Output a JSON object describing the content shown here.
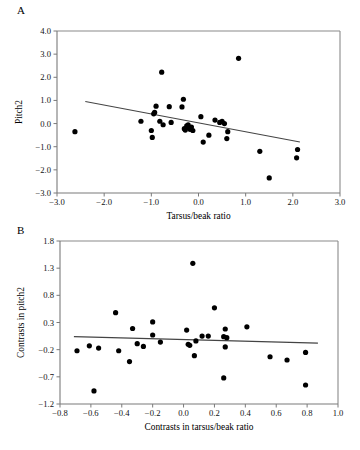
{
  "figure": {
    "background": "#ffffff",
    "point_color": "#000000",
    "line_color": "#444444",
    "axis_color": "#7a7a7a"
  },
  "panels": [
    {
      "letter": "A",
      "id": "panel-a"
    },
    {
      "letter": "B",
      "id": "panel-b"
    }
  ],
  "chart_data": [
    {
      "type": "scatter",
      "panel": "A",
      "title": "",
      "xlabel": "Tarsus/beak ratio",
      "ylabel": "Pitch2",
      "xlim": [
        -3.0,
        3.0
      ],
      "ylim": [
        -3.0,
        4.0
      ],
      "xticks": [
        -3.0,
        -2.0,
        -1.0,
        0.0,
        1.0,
        2.0,
        3.0
      ],
      "xtick_labels": [
        "-3.0",
        "-2.0",
        "-1.0",
        "0.0",
        "1.0",
        "2.0",
        "3.0"
      ],
      "yticks": [
        -3.0,
        -2.0,
        -1.0,
        0.0,
        1.0,
        2.0,
        3.0,
        4.0
      ],
      "ytick_labels": [
        "-3.0",
        "-2.0",
        "-1.0",
        "0.0",
        "1.0",
        "2.0",
        "3.0",
        "4.0"
      ],
      "grid": false,
      "legend": false,
      "x": [
        -2.62,
        -1.22,
        -1.0,
        -0.98,
        -0.95,
        -0.93,
        -0.9,
        -0.82,
        -0.78,
        -0.75,
        -0.62,
        -0.58,
        -0.35,
        -0.32,
        -0.3,
        -0.28,
        -0.25,
        -0.22,
        -0.2,
        -0.18,
        -0.15,
        -0.12,
        0.05,
        0.1,
        0.22,
        0.35,
        0.45,
        0.5,
        0.55,
        0.6,
        0.62,
        0.85,
        1.3,
        1.5,
        2.08,
        2.1
      ],
      "y": [
        -0.35,
        0.1,
        -0.3,
        -0.6,
        0.42,
        0.48,
        0.75,
        0.1,
        2.22,
        -0.05,
        0.73,
        0.05,
        0.72,
        1.05,
        -0.22,
        -0.28,
        -0.1,
        -0.05,
        -0.18,
        -0.25,
        -0.15,
        -0.3,
        0.3,
        -0.8,
        -0.5,
        0.15,
        0.05,
        0.1,
        0.0,
        -0.65,
        -0.35,
        2.82,
        -1.2,
        -2.35,
        -1.48,
        -1.12
      ],
      "trendline": {
        "x0": -2.4,
        "y0": 0.95,
        "x1": 2.15,
        "y1": -0.8,
        "slope": -0.385,
        "intercept": 0.026
      }
    },
    {
      "type": "scatter",
      "panel": "B",
      "title": "",
      "xlabel": "Contrasts in tarsus/beak ratio",
      "ylabel": "Contrasts in pitch2",
      "xlim": [
        -0.8,
        1.0
      ],
      "ylim": [
        -1.2,
        1.8
      ],
      "xticks": [
        -0.8,
        -0.6,
        -0.4,
        -0.2,
        0.0,
        0.2,
        0.4,
        0.6,
        0.8,
        1.0
      ],
      "xtick_labels": [
        "-0.8",
        "-0.6",
        "-0.4",
        "-0.2",
        "0.0",
        "0.2",
        "0.4",
        "0.6",
        "0.8",
        "1.0"
      ],
      "yticks": [
        -1.2,
        -0.7,
        -0.2,
        0.3,
        0.8,
        1.3,
        1.8
      ],
      "ytick_labels": [
        "-1.2",
        "-0.7",
        "-0.2",
        "0.3",
        "0.8",
        "1.3",
        "1.8"
      ],
      "grid": false,
      "legend": false,
      "x": [
        -0.69,
        -0.61,
        -0.58,
        -0.55,
        -0.44,
        -0.42,
        -0.35,
        -0.33,
        -0.3,
        -0.26,
        -0.2,
        -0.2,
        -0.15,
        0.02,
        0.03,
        0.04,
        0.06,
        0.07,
        0.08,
        0.12,
        0.16,
        0.2,
        0.26,
        0.26,
        0.27,
        0.27,
        0.28,
        0.41,
        0.56,
        0.67,
        0.79,
        0.79
      ],
      "y": [
        -0.22,
        -0.13,
        -0.96,
        -0.17,
        0.48,
        -0.22,
        -0.42,
        0.19,
        -0.09,
        -0.14,
        0.31,
        0.07,
        -0.06,
        0.16,
        -0.1,
        -0.12,
        1.39,
        -0.31,
        -0.04,
        0.05,
        0.05,
        0.57,
        -0.72,
        0.04,
        0.18,
        -0.15,
        0.02,
        0.22,
        -0.33,
        -0.39,
        -0.25,
        -0.85
      ],
      "trendline": {
        "x0": -0.71,
        "y0": 0.04,
        "x1": 0.87,
        "y1": -0.08,
        "slope": -0.076,
        "intercept": -0.014
      }
    }
  ]
}
